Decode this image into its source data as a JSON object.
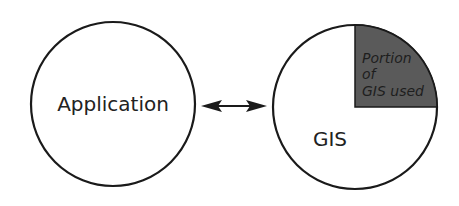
{
  "diagram": {
    "left_node": {
      "label": "Application"
    },
    "right_node": {
      "label": "GIS"
    },
    "portion": {
      "lines": [
        "Portion",
        "of",
        "GIS used"
      ]
    },
    "connector": {
      "type": "bidirectional-arrow"
    },
    "colors": {
      "stroke": "#1a1a1a",
      "portion_fill": "#5a5a5a",
      "background": "#ffffff"
    }
  }
}
